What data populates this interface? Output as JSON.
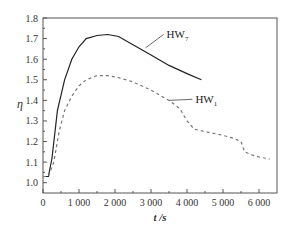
{
  "chart_data": {
    "type": "line",
    "title": "",
    "xlabel": "t /s",
    "ylabel": "η",
    "xlim": [
      0,
      6500
    ],
    "ylim": [
      0.95,
      1.8
    ],
    "xticks": [
      0,
      1000,
      2000,
      3000,
      4000,
      5000,
      6000
    ],
    "xtick_labels": [
      "0",
      "1 000",
      "2 000",
      "3 000",
      "4 000",
      "5 000",
      "6 000"
    ],
    "yticks": [
      1.0,
      1.1,
      1.2,
      1.3,
      1.4,
      1.5,
      1.6,
      1.7,
      1.8
    ],
    "ytick_labels": [
      "1.0",
      "1.1",
      "1.2",
      "1.3",
      "1.4",
      "1.5",
      "1.6",
      "1.7",
      "1.8"
    ],
    "grid": false,
    "legend": "inline annotations",
    "series": [
      {
        "name": "HW7",
        "label_main": "HW",
        "label_sub": "7",
        "style": "solid",
        "x": [
          0,
          150,
          250,
          400,
          600,
          800,
          1000,
          1200,
          1500,
          1800,
          2100,
          2500,
          3000,
          3500,
          4000,
          4400
        ],
        "y": [
          1.03,
          1.03,
          1.12,
          1.35,
          1.5,
          1.6,
          1.66,
          1.7,
          1.715,
          1.72,
          1.71,
          1.67,
          1.62,
          1.57,
          1.53,
          1.5
        ]
      },
      {
        "name": "HW1",
        "label_main": "HW",
        "label_sub": "1",
        "style": "dashed",
        "x": [
          0,
          150,
          300,
          450,
          600,
          800,
          1000,
          1200,
          1500,
          1800,
          2100,
          2500,
          3000,
          3500,
          3800,
          4000,
          4200,
          4600,
          5000,
          5300,
          5500,
          5600,
          5800,
          6000,
          6300
        ],
        "y": [
          1.03,
          1.03,
          1.1,
          1.25,
          1.35,
          1.42,
          1.47,
          1.5,
          1.52,
          1.52,
          1.51,
          1.49,
          1.45,
          1.4,
          1.36,
          1.3,
          1.26,
          1.245,
          1.23,
          1.215,
          1.2,
          1.15,
          1.135,
          1.125,
          1.115
        ]
      }
    ],
    "annotations": [
      {
        "text": "HW7",
        "series": "HW7",
        "pointer_from": [
          2850,
          1.655
        ],
        "pointer_to": [
          3350,
          1.72
        ]
      },
      {
        "text": "HW1",
        "series": "HW1",
        "pointer_from": [
          3500,
          1.4
        ],
        "pointer_to": [
          4150,
          1.405
        ]
      }
    ]
  }
}
